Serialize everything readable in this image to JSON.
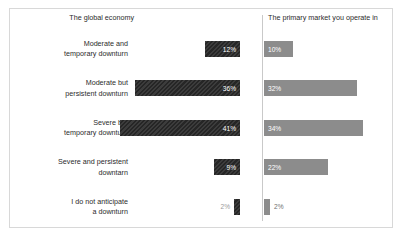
{
  "chart_data": {
    "type": "bar",
    "title": "",
    "subtitle": "",
    "xlabel": "",
    "ylabel": "",
    "orientation": "horizontal",
    "layout": "diverging-paired-columns",
    "grid": false,
    "legend_position": "top-as-column-headers",
    "axis_range_percent": [
      0,
      45
    ],
    "categories": [
      "Moderate and\ntemporary downturn",
      "Moderate but\npersistent downturn",
      "Severe but\ntemporary downturn",
      "Severe and persistent\ndowntarn",
      "I do not anticipate\na downturn"
    ],
    "series": [
      {
        "name": "The global economy",
        "color": "#262626",
        "side": "left",
        "values": [
          12,
          36,
          41,
          9,
          2
        ],
        "value_labels": [
          "12%",
          "36%",
          "41%",
          "9%",
          "2%"
        ]
      },
      {
        "name": "The primary market you operate in",
        "color": "#8c8c8c",
        "side": "right",
        "values": [
          10,
          32,
          34,
          22,
          2
        ],
        "value_labels": [
          "10%",
          "32%",
          "34%",
          "22%",
          "2%"
        ]
      }
    ]
  },
  "headers": {
    "left": "The global economy",
    "right": "The primary market you operate in"
  },
  "rows": [
    {
      "label_line1": "Moderate and",
      "label_line2": "temporary downturn",
      "left_value": "12%",
      "right_value": "10%",
      "left_pct": 12,
      "right_pct": 10,
      "left_label_inside": true,
      "right_label_inside": true
    },
    {
      "label_line1": "Moderate but",
      "label_line2": "persistent downturn",
      "left_value": "36%",
      "right_value": "32%",
      "left_pct": 36,
      "right_pct": 32,
      "left_label_inside": true,
      "right_label_inside": true
    },
    {
      "label_line1": "Severe but",
      "label_line2": "temporary downturn",
      "left_value": "41%",
      "right_value": "34%",
      "left_pct": 41,
      "right_pct": 34,
      "left_label_inside": true,
      "right_label_inside": true
    },
    {
      "label_line1": "Severe and persistent",
      "label_line2": "downtarn",
      "left_value": "9%",
      "right_value": "22%",
      "left_pct": 9,
      "right_pct": 22,
      "left_label_inside": true,
      "right_label_inside": true
    },
    {
      "label_line1": "I do not anticipate",
      "label_line2": "a downturn",
      "left_value": "2%",
      "right_value": "2%",
      "left_pct": 2,
      "right_pct": 2,
      "left_label_inside": false,
      "right_label_inside": false
    }
  ],
  "colors": {
    "left_series": "#262626",
    "right_series": "#8c8c8c",
    "frame_border": "#d8d8d8",
    "divider": "#c9c9c9",
    "text": "#2b2b2b",
    "outside_label": "#9a9a9a",
    "inside_label": "#ffffff"
  },
  "scale": {
    "pixels_per_percent": 2.92,
    "min_bar_px": 6
  }
}
